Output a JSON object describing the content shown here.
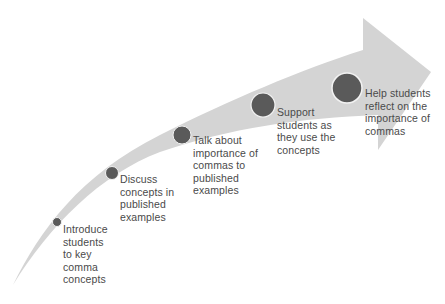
{
  "diagram": {
    "type": "curved-arrow-process",
    "colors": {
      "arrow_fill": "#d4d4d4",
      "circle_fill": "#5a5a5a",
      "circle_stroke": "#f2f2f2",
      "text": "#4a4a4a",
      "background": "#ffffff"
    },
    "steps": [
      {
        "id": 1,
        "lines": [
          "Introduce",
          "students",
          "to key",
          "comma",
          "concepts"
        ],
        "text": "Introduce students to key comma concepts"
      },
      {
        "id": 2,
        "lines": [
          "Discuss",
          "concepts in",
          "published",
          "examples"
        ],
        "text": "Discuss concepts in published examples"
      },
      {
        "id": 3,
        "lines": [
          "Talk about",
          "importance of",
          "commas to",
          "published",
          "examples"
        ],
        "text": "Talk about importance of commas to published examples"
      },
      {
        "id": 4,
        "lines": [
          "Support",
          "students as",
          "they use the",
          "concepts"
        ],
        "text": "Support students as they use the concepts"
      },
      {
        "id": 5,
        "lines": [
          "Help students",
          "reflect on the",
          "importance of",
          "commas"
        ],
        "text": "Help students reflect on the importance of commas"
      }
    ]
  }
}
